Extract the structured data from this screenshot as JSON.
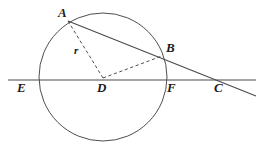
{
  "figure": {
    "type": "euclidean-geometry-diagram",
    "background_color": "#ffffff",
    "stroke_color": "#3a3a3a",
    "label_color": "#1a1a1a",
    "circle": {
      "name": "main-circle",
      "center_label": "D",
      "cx": 103,
      "cy": 77,
      "r": 64,
      "stroke_width": 0.9
    },
    "points": [
      {
        "id": "A",
        "label": "A",
        "x": 68,
        "y": 21,
        "label_x": 58,
        "label_y": 6,
        "on_circle": true
      },
      {
        "id": "B",
        "label": "B",
        "x": 162,
        "y": 56,
        "label_x": 166,
        "label_y": 41,
        "on_circle": true
      },
      {
        "id": "C",
        "label": "C",
        "x": 217,
        "y": 80,
        "label_x": 214,
        "label_y": 81,
        "on_circle": false
      },
      {
        "id": "D",
        "label": "D",
        "x": 103,
        "y": 78,
        "label_x": 97,
        "label_y": 81,
        "on_circle": false
      },
      {
        "id": "E",
        "label": "E",
        "x": 39,
        "y": 80,
        "label_x": 17,
        "label_y": 81,
        "on_circle": true
      },
      {
        "id": "F",
        "label": "F",
        "x": 167,
        "y": 80,
        "label_x": 167,
        "label_y": 81,
        "on_circle": true
      }
    ],
    "segments": [
      {
        "id": "secant-ABC",
        "name": "secant-line-a-b-c",
        "from": "A",
        "to": "C",
        "x1": 68,
        "y1": 21,
        "x2": 256,
        "y2": 96,
        "style": "solid"
      },
      {
        "id": "diameter-EFC",
        "name": "diameter-line-e-d-f-c",
        "from": "E",
        "to": "C",
        "x1": 8,
        "y1": 80,
        "x2": 256,
        "y2": 80,
        "style": "solid"
      },
      {
        "id": "radius-DA",
        "name": "radius-segment-d-a",
        "from": "D",
        "to": "A",
        "x1": 103,
        "y1": 78,
        "x2": 68,
        "y2": 21,
        "style": "dashed"
      },
      {
        "id": "radius-DB",
        "name": "radius-segment-d-b",
        "from": "D",
        "to": "B",
        "x1": 103,
        "y1": 78,
        "x2": 162,
        "y2": 56,
        "style": "dashed"
      }
    ],
    "measure_labels": [
      {
        "id": "r",
        "label": "r",
        "x": 74,
        "y": 45,
        "refers_to": "radius-DA"
      }
    ]
  }
}
